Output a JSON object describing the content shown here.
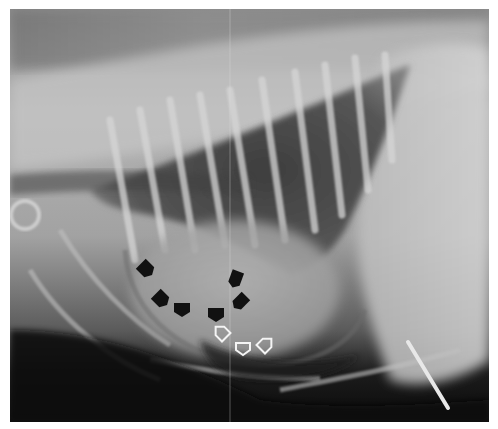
{
  "image": {
    "description": "Lateral thoracic radiograph (grayscale X-ray) showing rib cage, dorsal spine, lung fields, and cardiac silhouette with annotation arrows",
    "colors": {
      "border": "#ffffff",
      "soft_tissue": "#a9a9a9",
      "bone_bright": "#dcdcdc",
      "lung_dark": "#4a4a4a",
      "background_dark": "#0e0e0e",
      "arrow_black": "#111111",
      "arrow_white_outline": "#f4f4f4"
    },
    "annotations": {
      "black_arrows": [
        {
          "x": 145,
          "y": 268,
          "angle": 135
        },
        {
          "x": 160,
          "y": 298,
          "angle": 135
        },
        {
          "x": 182,
          "y": 308,
          "angle": 180
        },
        {
          "x": 216,
          "y": 313,
          "angle": 180
        },
        {
          "x": 236,
          "y": 278,
          "angle": 200
        },
        {
          "x": 241,
          "y": 301,
          "angle": 225
        }
      ],
      "white_arrows": [
        {
          "x": 222,
          "y": 333,
          "angle": -45
        },
        {
          "x": 243,
          "y": 348,
          "angle": 180
        },
        {
          "x": 265,
          "y": 345,
          "angle": 45
        }
      ]
    }
  }
}
